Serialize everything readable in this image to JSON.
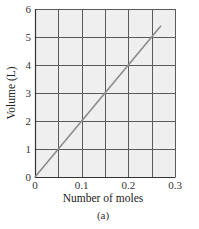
{
  "chart_data": {
    "type": "line",
    "title": "",
    "caption": "(a)",
    "xlabel": "Number of moles",
    "ylabel": "Volume (L)",
    "xlim": [
      0,
      0.3
    ],
    "ylim": [
      0,
      6
    ],
    "x_ticks": [
      0,
      0.1,
      0.2,
      0.3
    ],
    "x_tick_labels": [
      "0",
      "0.1",
      "0.2",
      "0.3"
    ],
    "y_ticks": [
      0,
      1,
      2,
      3,
      4,
      5,
      6
    ],
    "y_tick_labels": [
      "0",
      "1",
      "2",
      "3",
      "4",
      "5",
      "6"
    ],
    "x_grid_step": 0.05,
    "y_grid_step": 1,
    "grid": true,
    "legend": "none",
    "series": [
      {
        "name": "Volume vs moles",
        "x": [
          0,
          0.27
        ],
        "y": [
          0,
          5.4
        ],
        "color": "#8c8c8c"
      }
    ],
    "colors": {
      "plot_background": "#efefef",
      "grid": "#5a5a5a",
      "line": "#8c8c8c"
    }
  }
}
